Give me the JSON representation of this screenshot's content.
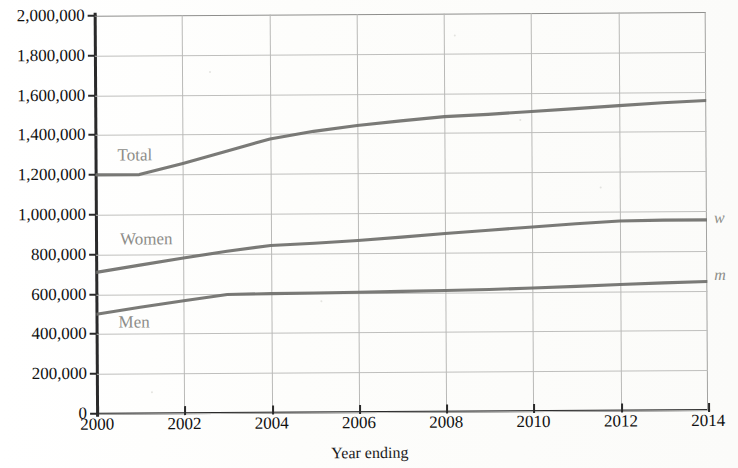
{
  "chart_data": {
    "type": "line",
    "title": "",
    "xlabel": "Year ending",
    "ylabel": "",
    "x": [
      2000,
      2001,
      2002,
      2003,
      2004,
      2005,
      2006,
      2007,
      2008,
      2009,
      2010,
      2011,
      2012,
      2013,
      2014
    ],
    "xlim": [
      2000,
      2014
    ],
    "ylim": [
      0,
      2000000
    ],
    "xticks": [
      "2000",
      "2002",
      "2004",
      "2006",
      "2008",
      "2010",
      "2012",
      "2014"
    ],
    "yticks": [
      "0",
      "200,000",
      "400,000",
      "600,000",
      "800,000",
      "1,000,000",
      "1,200,000",
      "1,400,000",
      "1,600,000",
      "1,800,000",
      "2,000,000"
    ],
    "grid": true,
    "legend_position": "in-plot labels and right-edge markers",
    "series": [
      {
        "name": "Total",
        "label": "Total",
        "edge_marker": "",
        "color": "#6f6f6b",
        "values": [
          1200000,
          1200000,
          1255000,
          1315000,
          1375000,
          1412000,
          1440000,
          1462000,
          1482000,
          1492000,
          1505000,
          1518000,
          1532000,
          1545000,
          1555000
        ]
      },
      {
        "name": "Women",
        "label": "Women",
        "edge_marker": "w",
        "color": "#6f6f6b",
        "values": [
          710000,
          745000,
          780000,
          812000,
          840000,
          850000,
          862000,
          878000,
          895000,
          910000,
          925000,
          940000,
          952000,
          955000,
          955000
        ]
      },
      {
        "name": "Men",
        "label": "Men",
        "edge_marker": "m",
        "color": "#6f6f6b",
        "values": [
          500000,
          533000,
          565000,
          595000,
          598000,
          600000,
          602000,
          605000,
          608000,
          612000,
          618000,
          625000,
          633000,
          640000,
          645000
        ]
      }
    ],
    "annotations": [
      {
        "text": "Total",
        "x": 2000.6,
        "y": 1290000
      },
      {
        "text": "Women",
        "x": 2000.6,
        "y": 905000
      },
      {
        "text": "Men",
        "x": 2000.9,
        "y": 432000
      }
    ]
  },
  "axis": {
    "x_title": "Year ending",
    "x_tick_labels": [
      "2000",
      "2002",
      "2004",
      "2006",
      "2008",
      "2010",
      "2012",
      "2014"
    ],
    "y_tick_labels": [
      "2,000,000",
      "1,800,000",
      "1,600,000",
      "1,400,000",
      "1,200,000",
      "1,000,000",
      "800,000",
      "600,000",
      "400,000",
      "200,000",
      "0"
    ]
  },
  "labels": {
    "total": "Total",
    "women": "Women",
    "men": "Men",
    "w_marker": "w",
    "m_marker": "m"
  },
  "title_strip": ""
}
